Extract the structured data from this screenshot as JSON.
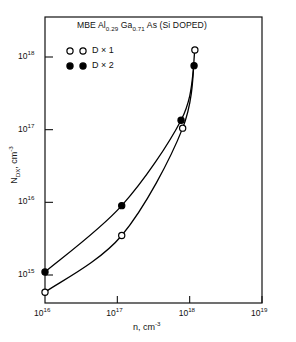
{
  "chart_data": {
    "type": "scatter",
    "title": "MBE Al0.29 Ga0.71 As (Si DOPED)",
    "title_parts": {
      "prefix": "MBE Al",
      "sub1": "0.29",
      "mid": " Ga",
      "sub2": "0.71",
      "suffix": " As (Si DOPED)"
    },
    "xlabel": "n, cm-3",
    "xlabel_parts": {
      "base": "n, cm",
      "sup": "-3"
    },
    "ylabel": "NDX, cm-3",
    "ylabel_parts": {
      "base": "N",
      "sub": "DX",
      "mid": ", cm",
      "sup": "-3"
    },
    "xscale": "log",
    "yscale": "log",
    "xlim": [
      1e+16,
      1e+19
    ],
    "ylim": [
      300000000000000.0,
      3e+18
    ],
    "grid": false,
    "legend_position": "top-left inside axes",
    "xticks": [
      {
        "value": 1e+16,
        "label_base": "10",
        "label_exp": "16"
      },
      {
        "value": 1e+17,
        "label_base": "10",
        "label_exp": "17"
      },
      {
        "value": 1e+18,
        "label_base": "10",
        "label_exp": "18"
      },
      {
        "value": 1e+19,
        "label_base": "10",
        "label_exp": "19"
      }
    ],
    "yticks": [
      {
        "value": 1000000000000000.0,
        "label_base": "10",
        "label_exp": "15"
      },
      {
        "value": 1e+16,
        "label_base": "10",
        "label_exp": "16"
      },
      {
        "value": 1e+17,
        "label_base": "10",
        "label_exp": "17"
      },
      {
        "value": 1e+18,
        "label_base": "10",
        "label_exp": "18"
      }
    ],
    "series": [
      {
        "name": "D x 1",
        "label_base": "D",
        "label_times": "×",
        "label_num": "1",
        "marker": "open-circle",
        "color": "#000000",
        "points": [
          {
            "x": 1e+16,
            "y": 580000000000000.0
          },
          {
            "x": 1.15e+17,
            "y": 3500000000000000.0
          },
          {
            "x": 8e+17,
            "y": 1.05e+17
          },
          {
            "x": 1.18e+18,
            "y": 1.25e+18
          }
        ]
      },
      {
        "name": "D x 2",
        "label_base": "D",
        "label_times": "×",
        "label_num": "2",
        "marker": "filled-circle",
        "color": "#000000",
        "points": [
          {
            "x": 1e+16,
            "y": 1100000000000000.0
          },
          {
            "x": 1.15e+17,
            "y": 9000000000000000.0
          },
          {
            "x": 7.6e+17,
            "y": 1.35e+17
          },
          {
            "x": 1.15e+18,
            "y": 7.6e+17
          }
        ]
      }
    ]
  }
}
